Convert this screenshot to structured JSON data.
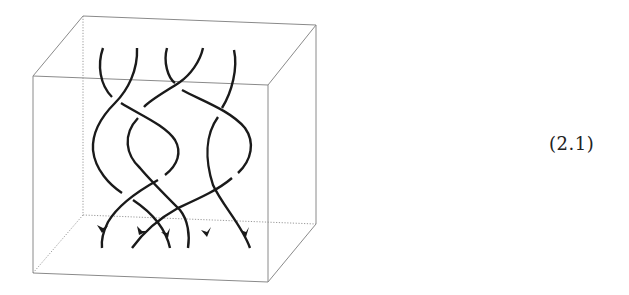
{
  "figure": {
    "type": "braid-in-cube",
    "equation_label": "(2.1)",
    "colors": {
      "box_edge": "#8a8a8a",
      "hidden_edge": "#9a9a9a",
      "strand": "#1a1a1a",
      "label": "#222222"
    },
    "cube": {
      "front_top_left": [
        33,
        76
      ],
      "front_top_right": [
        268,
        85
      ],
      "front_bottom_left": [
        33,
        273
      ],
      "front_bottom_right": [
        268,
        282
      ],
      "back_top_left": [
        83,
        16
      ],
      "back_top_right": [
        316,
        25
      ],
      "back_bottom_left": [
        83,
        215
      ],
      "back_bottom_right": [
        316,
        224
      ]
    },
    "strand_count": 5,
    "top_endpoints_x": [
      103,
      137,
      167,
      203,
      234
    ],
    "bottom_endpoints_x": [
      102,
      132,
      175,
      212,
      250
    ],
    "arrow_direction": "down"
  }
}
